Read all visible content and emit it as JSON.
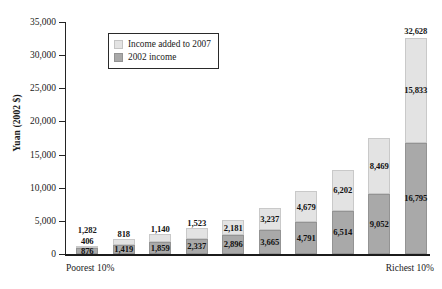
{
  "chart_data": {
    "type": "bar",
    "subtype": "stacked-column",
    "title": "",
    "xlabel": "",
    "ylabel": "Yuan (2002 $)",
    "ylim": [
      0,
      35000
    ],
    "ytick_values": [
      0,
      5000,
      10000,
      15000,
      20000,
      25000,
      30000,
      35000
    ],
    "ytick_labels": [
      "0",
      "5,000",
      "10,000",
      "15,000",
      "20,000",
      "25,000",
      "30,000",
      "35,000"
    ],
    "grid": false,
    "legend_position": "upper-left-inside",
    "categories": [
      "1",
      "2",
      "3",
      "4",
      "5",
      "6",
      "7",
      "8",
      "9",
      "10"
    ],
    "x_end_labels": {
      "left": "Poorest 10%",
      "right": "Richest 10%"
    },
    "series": [
      {
        "name": "2002 income",
        "color": "#a9a9a9",
        "values": [
          876,
          1419,
          1859,
          2337,
          2896,
          3665,
          4791,
          6514,
          9052,
          16795
        ],
        "value_labels": [
          "876",
          "1,419",
          "1,859",
          "2,337",
          "2,896",
          "3,665",
          "4,791",
          "6,514",
          "9,052",
          "16,795"
        ]
      },
      {
        "name": "Income added to 2007",
        "color": "#e3e3e3",
        "values": [
          406,
          818,
          1140,
          1523,
          2181,
          3237,
          4679,
          6202,
          8469,
          15833
        ],
        "value_labels": [
          "406",
          "818",
          "1,140",
          "1,523",
          "2,181",
          "3,237",
          "4,679",
          "6,202",
          "8,469",
          "15,833"
        ]
      }
    ],
    "totals": [
      1282,
      2237,
      2999,
      3860,
      5077,
      6902,
      9470,
      12716,
      17521,
      32628
    ],
    "total_labels_shown": {
      "1": "1,282",
      "10": "32,628"
    }
  },
  "legend": {
    "items": [
      {
        "label": "Income added to 2007",
        "color": "#e3e3e3"
      },
      {
        "label": "2002 income",
        "color": "#a9a9a9"
      }
    ]
  },
  "axis": {
    "y_label": "Yuan (2002 $)",
    "y_ticks": [
      "35,000",
      "30,000",
      "25,000",
      "20,000",
      "15,000",
      "10,000",
      "5,000",
      "0"
    ]
  },
  "x_axis": {
    "left_label": "Poorest 10%",
    "right_label": "Richest 10%"
  }
}
